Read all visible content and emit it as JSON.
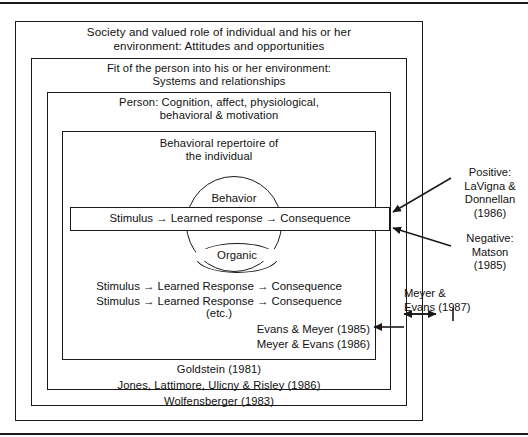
{
  "diagram": {
    "layers": {
      "society": "Society and valued role of individual and his or her\nenvironment: Attitudes and opportunities",
      "society_line1": "Society and valued role of individual and his or her",
      "society_line2": "environment: Attitudes and opportunities",
      "fit_line1": "Fit of the person into his or her environment:",
      "fit_line2": "Systems and relationships",
      "person_line1": "Person: Cognition, affect, physiological,",
      "person_line2": "behavioral & motivation",
      "repertoire_line1": "Behavioral repertoire of",
      "repertoire_line2": "the individual"
    },
    "circles": {
      "behavior": "Behavior",
      "organic": "Organic"
    },
    "chain": {
      "highlighted": "Stimulus → Learned  response → Consequence",
      "repeat_line1": "Stimulus → Learned  Response → Consequence",
      "repeat_line2": "Stimulus → Learned  Response → Consequence",
      "etc": "(etc.)"
    },
    "citations": {
      "evans_meyer_1985": "Evans & Meyer (1985)",
      "meyer_evans_1986": "Meyer & Evans (1986)",
      "goldstein_1981": "Goldstein (1981)",
      "jones_1986": "Jones, Lattimore, Ulicny & Risley (1986)",
      "wolfensberger_1983": "Wolfensberger (1983)",
      "positive_line1": "Positive:",
      "positive_line2": "LaVigna &",
      "positive_line3": "Donnellan",
      "positive_line4": "(1986)",
      "negative_line1": "Negative:",
      "negative_line2": "Matson",
      "negative_line3": "(1985)",
      "meyer_evans_1987_line1": "Meyer &",
      "meyer_evans_1987_line2": "Evans (1987)"
    },
    "colors": {
      "ink": "#1a1a1a",
      "background": "#ffffff"
    }
  }
}
